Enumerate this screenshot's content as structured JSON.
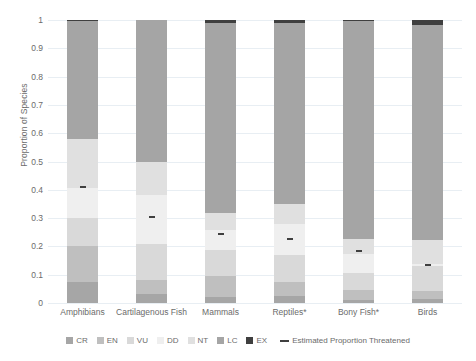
{
  "chart_data": {
    "type": "bar",
    "title": "",
    "xlabel": "",
    "ylabel": "Proportion of Species",
    "ylim": [
      0,
      1
    ],
    "grid": true,
    "stacked": true,
    "legend_position": "bottom",
    "categories": [
      "Amphibians",
      "Cartilagenous Fish",
      "Mammals",
      "Reptiles*",
      "Bony Fish*",
      "Birds"
    ],
    "yticks": [
      "1",
      "0.9",
      "0.8",
      "0.7",
      "0.6",
      "0.5",
      "0.4",
      "0.3",
      "0.2",
      "0.1",
      "0"
    ],
    "series": [
      {
        "name": "CR",
        "color": "#a6a6a6",
        "values": [
          0.075,
          0.032,
          0.022,
          0.025,
          0.012,
          0.014
        ]
      },
      {
        "name": "EN",
        "color": "#bfbfbf",
        "values": [
          0.125,
          0.048,
          0.075,
          0.05,
          0.035,
          0.028
        ]
      },
      {
        "name": "VU",
        "color": "#d9d9d9",
        "values": [
          0.1,
          0.13,
          0.09,
          0.095,
          0.06,
          0.09
        ]
      },
      {
        "name": "DD",
        "color": "#efefef",
        "values": [
          0.105,
          0.17,
          0.07,
          0.11,
          0.065,
          0.005
        ]
      },
      {
        "name": "NT",
        "color": "#e0e0e0",
        "values": [
          0.175,
          0.12,
          0.06,
          0.07,
          0.055,
          0.085
        ]
      },
      {
        "name": "LC",
        "color": "#a5a5a5",
        "values": [
          0.415,
          0.5,
          0.673,
          0.64,
          0.77,
          0.762
        ]
      },
      {
        "name": "EX",
        "color": "#3f3f3f",
        "values": [
          0.005,
          0.0,
          0.01,
          0.01,
          0.003,
          0.016
        ]
      }
    ],
    "threatened_marker": {
      "name": "Estimated Proportion Threatened",
      "color": "#3f3f3f",
      "values": [
        0.41,
        0.305,
        0.245,
        0.225,
        0.185,
        0.135
      ]
    }
  },
  "legend": {
    "items": [
      {
        "label": "CR"
      },
      {
        "label": "EN"
      },
      {
        "label": "VU"
      },
      {
        "label": "DD"
      },
      {
        "label": "NT"
      },
      {
        "label": "LC"
      },
      {
        "label": "EX"
      }
    ],
    "line_label": "Estimated Proportion Threatened"
  }
}
